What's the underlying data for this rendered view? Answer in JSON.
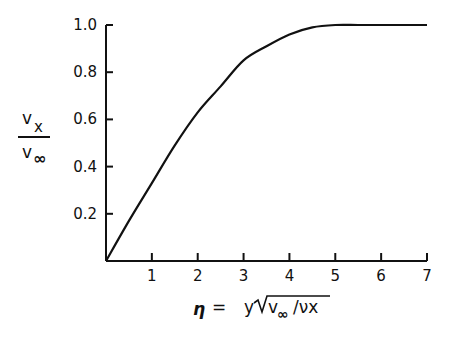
{
  "chart_data": {
    "type": "line",
    "title": "",
    "xlabel": "η = y√(v∞/νx)",
    "ylabel": "vx / v∞",
    "xlim": [
      0,
      7
    ],
    "ylim": [
      0,
      1.0
    ],
    "x_ticks": [
      "1",
      "2",
      "3",
      "4",
      "5",
      "6",
      "7"
    ],
    "y_ticks": [
      "0.2",
      "0.4",
      "0.6",
      "0.8",
      "1.0"
    ],
    "grid": false,
    "series": [
      {
        "name": "velocity profile",
        "x": [
          0,
          0.5,
          1,
          1.5,
          2,
          2.5,
          3,
          3.5,
          4,
          4.5,
          5,
          5.5,
          6,
          6.5,
          7
        ],
        "values": [
          0,
          0.17,
          0.33,
          0.49,
          0.63,
          0.74,
          0.85,
          0.91,
          0.96,
          0.99,
          1.0,
          1.0,
          1.0,
          1.0,
          1.0
        ]
      }
    ]
  },
  "labels": {
    "y_num": "v",
    "y_num_sub": "x",
    "y_den": "v",
    "y_den_sub": "∞",
    "x_eta": "η",
    "x_eq": "=",
    "x_y": "y",
    "x_v": "v",
    "x_inf": "∞",
    "x_rest": "/νx"
  }
}
